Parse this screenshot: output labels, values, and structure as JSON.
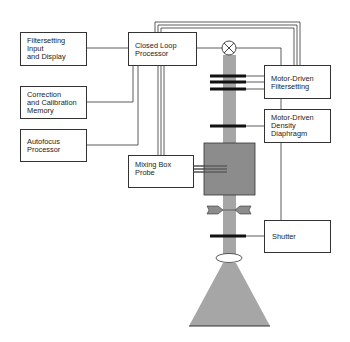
{
  "diagram": {
    "left_boxes": [
      {
        "id": "filtersetting-input",
        "lines": [
          "Filtersetting",
          "Input",
          "and Display"
        ]
      },
      {
        "id": "correction-memory",
        "lines": [
          "Correction",
          "and Calibration",
          "Memory"
        ]
      },
      {
        "id": "autofocus-processor",
        "lines": [
          "Autofocus",
          "Processor"
        ]
      }
    ],
    "center_boxes": [
      {
        "id": "closed-loop-processor",
        "lines": [
          "Closed Loop",
          "Processor"
        ]
      },
      {
        "id": "mixing-box-probe",
        "lines": [
          "Mixing Box",
          "Probe"
        ]
      }
    ],
    "right_boxes": [
      {
        "id": "motor-filtersetting",
        "lines": [
          "Motor-Driven",
          "Filtersetting"
        ]
      },
      {
        "id": "motor-density",
        "lines": [
          "Motor-Driven",
          "Density",
          "Diaphragm"
        ]
      },
      {
        "id": "shutter",
        "lines": [
          "Shutter"
        ]
      }
    ],
    "optical_path": {
      "components": [
        "lamp",
        "filter-bars",
        "density-diaphragm",
        "mixing-box",
        "aperture",
        "shutter-blade",
        "lens",
        "light-cone"
      ]
    },
    "colors": {
      "beam": "#a6a6a6",
      "mixing_box": "#8c8c8c",
      "line": "#333333",
      "bar": "#111111"
    }
  }
}
